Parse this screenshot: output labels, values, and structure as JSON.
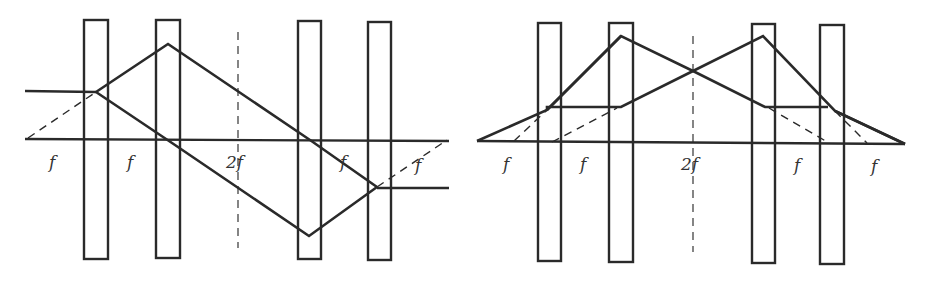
{
  "figures": [
    {
      "id": "left",
      "description": "Four-lens telescope system; incident parallel ray is inverted and exits parallel below axis",
      "labels": {
        "l1": "f",
        "l2": "f",
        "l3": "2f",
        "l4": "f",
        "l5": "f"
      }
    },
    {
      "id": "right",
      "description": "Symmetric four-lens system; rays from an axial point cross at the 2f plane and converge to an axial image",
      "labels": {
        "l1": "f",
        "l2": "f",
        "l3": "2f",
        "l4": "f",
        "l5": "f"
      }
    }
  ],
  "colors": {
    "stroke": "#2a2a2a",
    "background": "#ffffff",
    "text": "#333333"
  }
}
